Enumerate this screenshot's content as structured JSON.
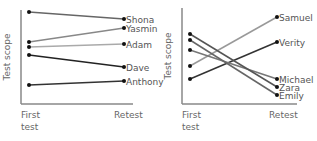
{
  "chart_data": [
    {
      "type": "line",
      "title": "",
      "xlabel": "",
      "ylabel": "Test scope",
      "categories": [
        "First test",
        "Retest"
      ],
      "x_tick_labels": [
        [
          "First",
          "test"
        ],
        [
          "Retest"
        ]
      ],
      "grid": false,
      "legend": "direct labels at right end of lines",
      "series": [
        {
          "name": "Shona",
          "values": [
            12,
            19
          ],
          "color": "#666666"
        },
        {
          "name": "Yasmin",
          "values": [
            42,
            28
          ],
          "color": "#888888"
        },
        {
          "name": "Adam",
          "values": [
            47,
            44
          ],
          "color": "#aaaaaa"
        },
        {
          "name": "Dave",
          "values": [
            55,
            67
          ],
          "color": "#222222"
        },
        {
          "name": "Anthony",
          "values": [
            85,
            81
          ],
          "color": "#333333"
        }
      ],
      "note": "values are pixel y-positions (smaller = higher score); no numeric axis shown"
    },
    {
      "type": "line",
      "title": "",
      "xlabel": "",
      "ylabel": "Test scope",
      "categories": [
        "First test",
        "Retest"
      ],
      "x_tick_labels": [
        [
          "First",
          "test"
        ],
        [
          "Retest"
        ]
      ],
      "grid": false,
      "legend": "direct labels at right end of lines",
      "series": [
        {
          "name": "Samuel",
          "values": [
            66,
            17
          ],
          "color": "#999999"
        },
        {
          "name": "Verity",
          "values": [
            79,
            42
          ],
          "color": "#333333"
        },
        {
          "name": "Michael",
          "values": [
            50,
            79
          ],
          "color": "#777777"
        },
        {
          "name": "Zara",
          "values": [
            34,
            87
          ],
          "color": "#555555"
        },
        {
          "name": "Emily",
          "values": [
            40,
            95
          ],
          "color": "#666666"
        }
      ],
      "note": "values are pixel y-positions (smaller = higher score); no numeric axis shown"
    }
  ]
}
